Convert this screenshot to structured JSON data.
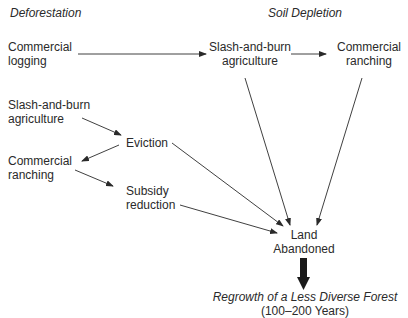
{
  "headers": {
    "left": "Deforestation",
    "right": "Soil Depletion"
  },
  "nodes": {
    "commercial_logging": [
      "Commercial",
      "logging"
    ],
    "slash_burn_top": [
      "Slash-and-burn",
      "agriculture"
    ],
    "commercial_ranching_top": [
      "Commercial",
      "ranching"
    ],
    "slash_burn_left": [
      "Slash-and-burn",
      "agriculture"
    ],
    "eviction": "Eviction",
    "commercial_ranching_left": [
      "Commercial",
      "ranching"
    ],
    "subsidy_reduction": [
      "Subsidy",
      "reduction"
    ],
    "land_abandoned": [
      "Land",
      "Abandoned"
    ],
    "regrowth": "Regrowth of a Less Diverse Forest",
    "regrowth_years": "(100–200 Years)"
  },
  "edges": [
    {
      "from": "commercial_logging",
      "to": "slash_burn_top"
    },
    {
      "from": "slash_burn_top",
      "to": "commercial_ranching_top"
    },
    {
      "from": "slash_burn_left",
      "to": "eviction"
    },
    {
      "from": "eviction",
      "to": "commercial_ranching_left"
    },
    {
      "from": "commercial_ranching_left",
      "to": "subsidy_reduction"
    },
    {
      "from": "slash_burn_top",
      "to": "land_abandoned"
    },
    {
      "from": "commercial_ranching_top",
      "to": "land_abandoned"
    },
    {
      "from": "eviction",
      "to": "land_abandoned"
    },
    {
      "from": "subsidy_reduction",
      "to": "land_abandoned"
    },
    {
      "from": "land_abandoned",
      "to": "regrowth",
      "style": "thick"
    }
  ]
}
